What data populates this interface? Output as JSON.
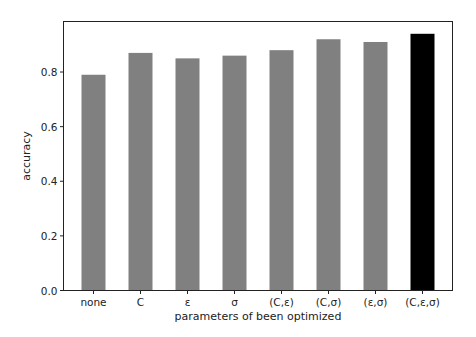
{
  "chart_data": {
    "type": "bar",
    "title": "",
    "xlabel": "parameters of been optimized",
    "ylabel": "accuracy",
    "categories": [
      "none",
      "C",
      "ε",
      "σ",
      "(C,ε)",
      "(C,σ)",
      "(ε,σ)",
      "(C,ε,σ)"
    ],
    "values": [
      0.79,
      0.87,
      0.85,
      0.86,
      0.88,
      0.92,
      0.91,
      0.94
    ],
    "bar_colors": [
      "#808080",
      "#808080",
      "#808080",
      "#808080",
      "#808080",
      "#808080",
      "#808080",
      "#000000"
    ],
    "ylim": [
      0.0,
      0.985
    ],
    "yticks": [
      0.0,
      0.2,
      0.4,
      0.6,
      0.8
    ],
    "ytick_labels": [
      "0.0",
      "0.2",
      "0.4",
      "0.6",
      "0.8"
    ],
    "grid": false,
    "legend": null
  }
}
